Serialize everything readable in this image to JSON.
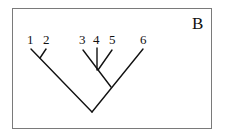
{
  "panel_label": "B",
  "tree": {
    "type": "cladogram",
    "leaves": [
      {
        "label": "1",
        "x": 31
      },
      {
        "label": "2",
        "x": 47
      },
      {
        "label": "3",
        "x": 83
      },
      {
        "label": "4",
        "x": 97
      },
      {
        "label": "5",
        "x": 113
      },
      {
        "label": "6",
        "x": 143
      }
    ],
    "topology": "((1,2),((3,4,5),6))"
  }
}
